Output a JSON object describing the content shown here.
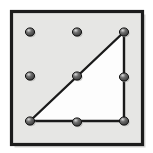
{
  "figure": {
    "title": "Geoboard right triangle on a 3 by 3 peg grid",
    "caption": "",
    "canvas": {
      "width": 153,
      "height": 153
    },
    "colors": {
      "page_background": "#ffffff",
      "board_fill": "#e6e6e4",
      "board_border": "#1c1c1c",
      "shape_fill": "#fdfdfd",
      "shape_stroke": "#1a1a1a",
      "peg_fill": "#4a4a4a",
      "peg_highlight": "#cfcfcf",
      "peg_stroke": "#141414",
      "shadow": "#b3b3b0"
    },
    "board": {
      "name": "geoboard-frame",
      "x": 11.5,
      "y": 11.5,
      "width": 131,
      "height": 133,
      "border_width": 3.2
    },
    "grid": {
      "rows": 3,
      "columns": 3,
      "peg_radius": 4.6,
      "x_positions": [
        30,
        77,
        124
      ],
      "y_positions": [
        32,
        76,
        121
      ]
    },
    "pegs": [
      {
        "id": "peg-r1c1",
        "label": "top-left",
        "x": 30,
        "y": 32,
        "on_shape": false
      },
      {
        "id": "peg-r1c2",
        "label": "top-center",
        "x": 77,
        "y": 32,
        "on_shape": false
      },
      {
        "id": "peg-r1c3",
        "label": "top-right",
        "x": 124,
        "y": 32,
        "on_shape": true
      },
      {
        "id": "peg-r2c1",
        "label": "middle-left",
        "x": 30,
        "y": 76,
        "on_shape": false
      },
      {
        "id": "peg-r2c2",
        "label": "middle-center",
        "x": 77,
        "y": 76,
        "on_shape": true
      },
      {
        "id": "peg-r2c3",
        "label": "middle-right",
        "x": 124,
        "y": 77,
        "on_shape": true
      },
      {
        "id": "peg-r3c1",
        "label": "bottom-left",
        "x": 30,
        "y": 121,
        "on_shape": true
      },
      {
        "id": "peg-r3c2",
        "label": "bottom-center",
        "x": 77,
        "y": 122,
        "on_shape": true
      },
      {
        "id": "peg-r3c3",
        "label": "bottom-right",
        "x": 124,
        "y": 121,
        "on_shape": true
      }
    ],
    "shape": {
      "name": "right-triangle",
      "type": "polygon",
      "vertices": [
        {
          "peg": "peg-r3c1",
          "x": 30,
          "y": 121
        },
        {
          "peg": "peg-r1c3",
          "x": 124,
          "y": 32
        },
        {
          "peg": "peg-r3c3",
          "x": 124,
          "y": 121
        }
      ],
      "points": "30,121 124,32 124,121",
      "stroke_width": 2.4,
      "right_angle_at": "peg-r3c3"
    }
  }
}
